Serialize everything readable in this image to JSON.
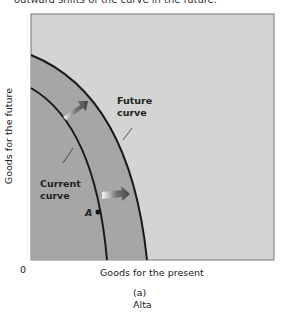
{
  "header": {
    "caption_fragment": "outward shifts of the curve in the future."
  },
  "diagram": {
    "y_axis_label": "Goods for the future",
    "x_axis_label": "Goods for the present",
    "origin_label": "0",
    "future_curve_label_line1": "Future",
    "future_curve_label_line2": "curve",
    "current_curve_label_line1": "Current",
    "current_curve_label_line2": "curve",
    "point_label": "A",
    "panel_label": "(a)",
    "panel_title": "Alta",
    "colors": {
      "background": "#d4d4d4",
      "shaded_region": "#a6a6a6",
      "curve": "#1a1a1a",
      "frame": "#777777"
    }
  }
}
